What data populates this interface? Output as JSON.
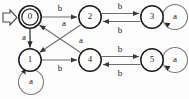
{
  "diagram": {
    "type": "finite-state-automaton",
    "title": "",
    "start_marker": {
      "name": "start-arrow",
      "glyph": "hollow-right-arrow",
      "target": "0"
    },
    "colors": {
      "node_stroke": "#1b1b1b",
      "edge_stroke": "#6e6e6e",
      "label_text": "#1a1a1a",
      "background": "#fdfdfd"
    },
    "alphabet": [
      "a",
      "b"
    ],
    "states": [
      {
        "id": "0",
        "label": "0",
        "accepting": true,
        "initial": true,
        "cx": 30,
        "cy": 17,
        "r": 11
      },
      {
        "id": "1",
        "label": "1",
        "accepting": false,
        "initial": false,
        "cx": 30,
        "cy": 60,
        "r": 11
      },
      {
        "id": "2",
        "label": "2",
        "accepting": false,
        "initial": false,
        "cx": 90,
        "cy": 17,
        "r": 11
      },
      {
        "id": "3",
        "label": "3",
        "accepting": false,
        "initial": false,
        "cx": 152,
        "cy": 17,
        "r": 11
      },
      {
        "id": "4",
        "label": "4",
        "accepting": false,
        "initial": false,
        "cx": 90,
        "cy": 60,
        "r": 11
      },
      {
        "id": "5",
        "label": "5",
        "accepting": false,
        "initial": false,
        "cx": 152,
        "cy": 60,
        "r": 11
      }
    ],
    "transitions": [
      {
        "from": "0",
        "to": "2",
        "label": "b",
        "lx": 60,
        "ly": 10,
        "kind": "straight-right"
      },
      {
        "from": "0",
        "to": "1",
        "label": "a",
        "lx": 24,
        "ly": 38,
        "kind": "straight-down"
      },
      {
        "from": "1",
        "to": "4",
        "label": "b",
        "lx": 60,
        "ly": 66,
        "kind": "straight-right"
      },
      {
        "from": "2",
        "to": "1",
        "label": "a",
        "lx": 62,
        "ly": 25,
        "kind": "diagonal-down-left"
      },
      {
        "from": "4",
        "to": "0",
        "label": "a",
        "lx": 80,
        "ly": 42,
        "kind": "diagonal-up-left"
      },
      {
        "from": "2",
        "to": "3",
        "label": "b",
        "lx": 121,
        "ly": 8,
        "kind": "parallel-top"
      },
      {
        "from": "3",
        "to": "2",
        "label": "b",
        "lx": 121,
        "ly": 30,
        "kind": "parallel-bottom"
      },
      {
        "from": "4",
        "to": "5",
        "label": "b",
        "lx": 121,
        "ly": 50,
        "kind": "parallel-top"
      },
      {
        "from": "5",
        "to": "4",
        "label": "b",
        "lx": 121,
        "ly": 73,
        "kind": "parallel-bottom"
      },
      {
        "from": "1",
        "to": "1",
        "label": "a",
        "lx": 31,
        "ly": 86,
        "kind": "self-loop-below"
      },
      {
        "from": "3",
        "to": "3",
        "label": "a",
        "lx": 176,
        "ly": 17,
        "kind": "self-loop-right"
      },
      {
        "from": "5",
        "to": "5",
        "label": "a",
        "lx": 176,
        "ly": 60,
        "kind": "self-loop-right"
      }
    ]
  }
}
